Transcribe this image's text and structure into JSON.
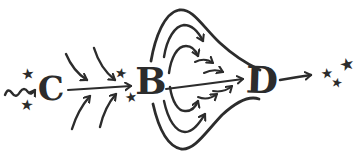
{
  "colors": {
    "ink": "#2c2c2c",
    "paper": "#ffffff"
  },
  "glyphs": {
    "star": "★"
  },
  "nodes": {
    "c": {
      "label": "C"
    },
    "b": {
      "label": "B"
    },
    "d": {
      "label": "D"
    }
  },
  "stars": {
    "left_count": 2,
    "near_b_count": 2,
    "right_count": 3
  },
  "edges": [
    {
      "from": "wavy-input",
      "to": "C",
      "style": "wavy-arrow"
    },
    {
      "from": "C",
      "to": "B",
      "style": "straight-arrow-with-converging-curved-arrows"
    },
    {
      "from": "B",
      "to": "D",
      "style": "straight-arrow-through-expanding-funnel-of-curved-arrows"
    },
    {
      "from": "D",
      "to": "star-cluster",
      "style": "straight-arrow"
    }
  ]
}
